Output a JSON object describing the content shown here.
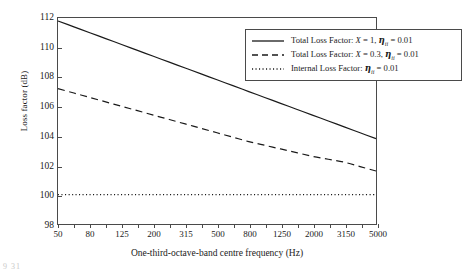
{
  "chart_data": {
    "type": "line",
    "title": "",
    "xlabel": "One-third-octave-band centre frequency (Hz)",
    "ylabel": "Loss factor (dB)",
    "x_tick_labels": [
      "50",
      "80",
      "125",
      "200",
      "315",
      "500",
      "800",
      "1250",
      "2000",
      "3150",
      "5000"
    ],
    "x_all_bands": [
      50,
      63,
      80,
      100,
      125,
      160,
      200,
      250,
      315,
      400,
      500,
      630,
      800,
      1000,
      1250,
      1600,
      2000,
      2500,
      3150,
      4000,
      5000
    ],
    "x_scale": "one-third-octave bands (log spaced, categorical)",
    "ylim": [
      98,
      112
    ],
    "y_ticks": [
      98,
      100,
      102,
      104,
      106,
      108,
      110,
      112
    ],
    "grid": false,
    "legend_position": "top-right inside plot",
    "series": [
      {
        "name": "Total Loss Factor: X = 1, eta_ii = 0.01",
        "style": "solid",
        "values": [
          111.8,
          111.4,
          111.0,
          110.6,
          110.2,
          109.8,
          109.4,
          109.0,
          108.6,
          108.2,
          107.8,
          107.4,
          107.0,
          106.6,
          106.2,
          105.8,
          105.4,
          105.0,
          104.6,
          104.2,
          103.8
        ]
      },
      {
        "name": "Total Loss Factor: X = 0.3, eta_ii = 0.01",
        "style": "dashed",
        "values": [
          107.2,
          106.9,
          106.6,
          106.3,
          106.0,
          105.7,
          105.4,
          105.1,
          104.8,
          104.5,
          104.2,
          103.9,
          103.6,
          103.35,
          103.1,
          102.85,
          102.6,
          102.4,
          102.2,
          101.9,
          101.6
        ]
      },
      {
        "name": "Internal Loss Factor: eta_ii = 0.01",
        "style": "dotted",
        "values": [
          100,
          100,
          100,
          100,
          100,
          100,
          100,
          100,
          100,
          100,
          100,
          100,
          100,
          100,
          100,
          100,
          100,
          100,
          100,
          100,
          100
        ]
      }
    ]
  },
  "legend": {
    "entries": [
      {
        "style": "solid",
        "prefix": "Total Loss Factor: ",
        "var": "X",
        "eq1": " = ",
        "val1": "1, ",
        "eta": "η",
        "sub": "ii",
        "eq2": " = ",
        "val2": "0.01"
      },
      {
        "style": "dashed",
        "prefix": "Total Loss Factor: ",
        "var": "X",
        "eq1": " = ",
        "val1": "0.3, ",
        "eta": "η",
        "sub": "ii",
        "eq2": " = ",
        "val2": "0.01"
      },
      {
        "style": "dotted",
        "prefix": "Internal Loss Factor: ",
        "var": "",
        "eq1": "",
        "val1": "",
        "eta": "η",
        "sub": "ii",
        "eq2": " = ",
        "val2": "0.01"
      }
    ]
  },
  "artifact": {
    "text": "9 31"
  },
  "colors": {
    "line": "#1a1a1a",
    "axis": "#4a4a4a",
    "background": "#ffffff"
  }
}
